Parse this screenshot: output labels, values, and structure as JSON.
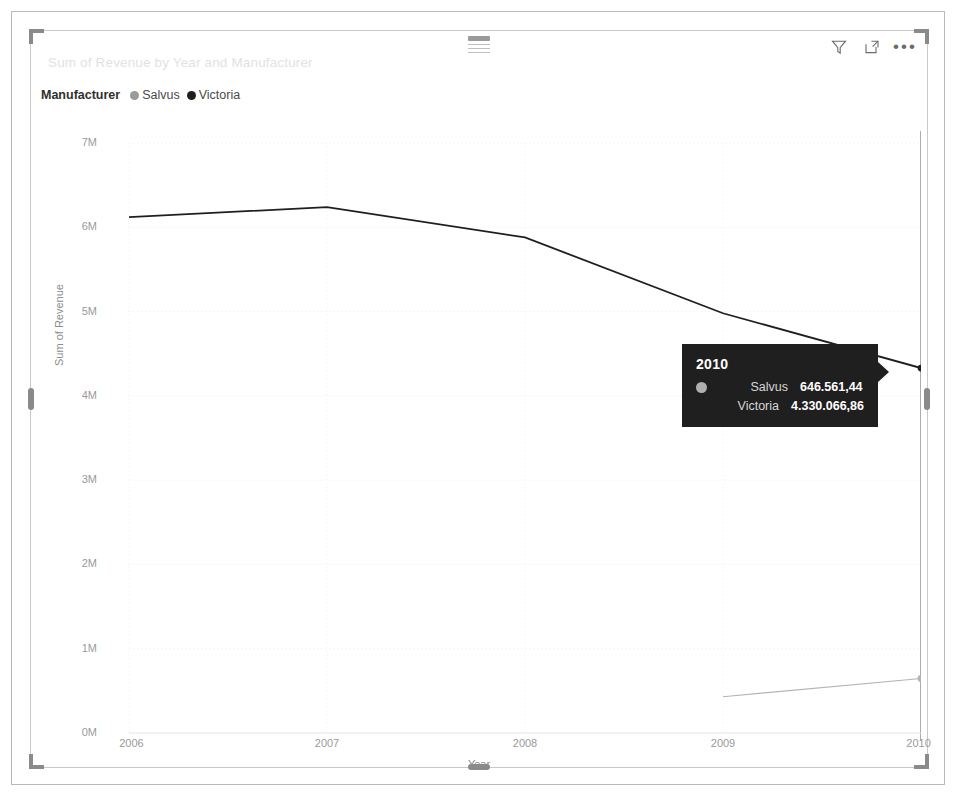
{
  "visual": {
    "title": "Sum of Revenue by Year and Manufacturer",
    "header_icons": [
      {
        "name": "filter-icon",
        "label": "Filters"
      },
      {
        "name": "focus-mode-icon",
        "label": "Focus mode"
      },
      {
        "name": "more-options-icon",
        "label": "More options"
      }
    ],
    "more_options_glyph": "•••",
    "drag_handle_label": "Drag to move"
  },
  "legend": {
    "title": "Manufacturer",
    "items": [
      {
        "label": "Salvus",
        "color": "#9a9a9a"
      },
      {
        "label": "Victoria",
        "color": "#1f1f1f"
      }
    ]
  },
  "tooltip": {
    "title": "2010",
    "rows": [
      {
        "name": "Salvus",
        "value": "646.561,44",
        "color": "#b0b0b0",
        "show_dot": true
      },
      {
        "name": "Victoria",
        "value": "4.330.066,86",
        "color": "#1f1f1f",
        "show_dot": false
      }
    ]
  },
  "chart_data": {
    "type": "line",
    "title": "Sum of Revenue by Year and Manufacturer",
    "xlabel": "Year",
    "ylabel": "Sum of Revenue",
    "x": [
      2006,
      2007,
      2008,
      2009,
      2010
    ],
    "xtick_labels": [
      "2006",
      "2007",
      "2008",
      "2009",
      "2010"
    ],
    "ytick_labels": [
      "0M",
      "1M",
      "2M",
      "3M",
      "4M",
      "5M",
      "6M",
      "7M"
    ],
    "ytick_values": [
      0,
      1000000,
      2000000,
      3000000,
      4000000,
      5000000,
      6000000,
      7000000
    ],
    "ylim": [
      0,
      7000000
    ],
    "xlim": [
      2006,
      2010
    ],
    "grid": true,
    "legend_position": "top-left",
    "hover_x": 2010,
    "series": [
      {
        "name": "Victoria",
        "color": "#1f1f1f",
        "values": [
          6120000,
          6240000,
          5880000,
          4980000,
          4330066.86
        ]
      },
      {
        "name": "Salvus",
        "color": "#b4b4b4",
        "values": [
          null,
          null,
          null,
          430000,
          646561.44
        ]
      }
    ]
  }
}
